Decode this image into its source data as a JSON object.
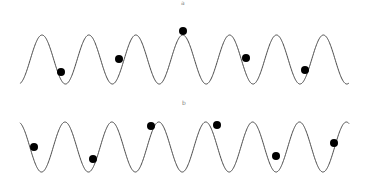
{
  "panels": [
    {
      "label": "a",
      "label_pos": [
        182,
        0
      ],
      "wave": {
        "x_start": 20,
        "x_end": 349,
        "period": 46.9,
        "first_peak_x": 42,
        "y_top": 35,
        "y_bottom": 84,
        "phase": "peak"
      },
      "dots": [
        [
          61,
          72
        ],
        [
          119,
          59
        ],
        [
          183,
          31
        ],
        [
          246,
          58
        ],
        [
          305,
          70
        ]
      ]
    },
    {
      "label": "b",
      "label_pos": [
        183,
        100
      ],
      "wave": {
        "x_start": 20,
        "x_end": 349,
        "period": 46.9,
        "first_peak_x": 65,
        "y_top": 122,
        "y_bottom": 172,
        "phase": "trough-first"
      },
      "dots": [
        [
          34,
          147
        ],
        [
          93,
          159
        ],
        [
          151,
          126
        ],
        [
          217,
          125
        ],
        [
          276,
          156
        ],
        [
          334,
          143
        ]
      ]
    }
  ],
  "style": {
    "line_color": "#4a4a4a",
    "dot_color": "#000000",
    "dot_radius": 4
  }
}
